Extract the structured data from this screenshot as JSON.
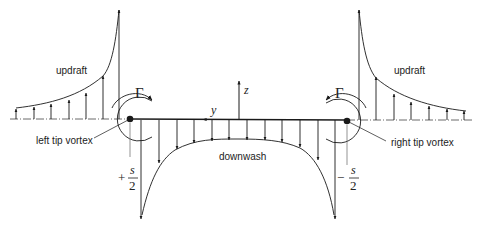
{
  "diagram": {
    "labels": {
      "updraft_left": "updraft",
      "updraft_right": "updraft",
      "downwash": "downwash",
      "left_tip_vortex": "left tip vortex",
      "right_tip_vortex": "right tip vortex",
      "gamma_left": "Γ",
      "gamma_right": "Γ",
      "z_axis": "z",
      "y_axis": "y",
      "left_sign": "+",
      "right_sign": "−",
      "s_numerator_left": "s",
      "s_denominator_left": "2",
      "s_numerator_right": "s",
      "s_denominator_right": "2"
    },
    "colors": {
      "line": "#1a1a1a",
      "background": "#ffffff"
    }
  }
}
